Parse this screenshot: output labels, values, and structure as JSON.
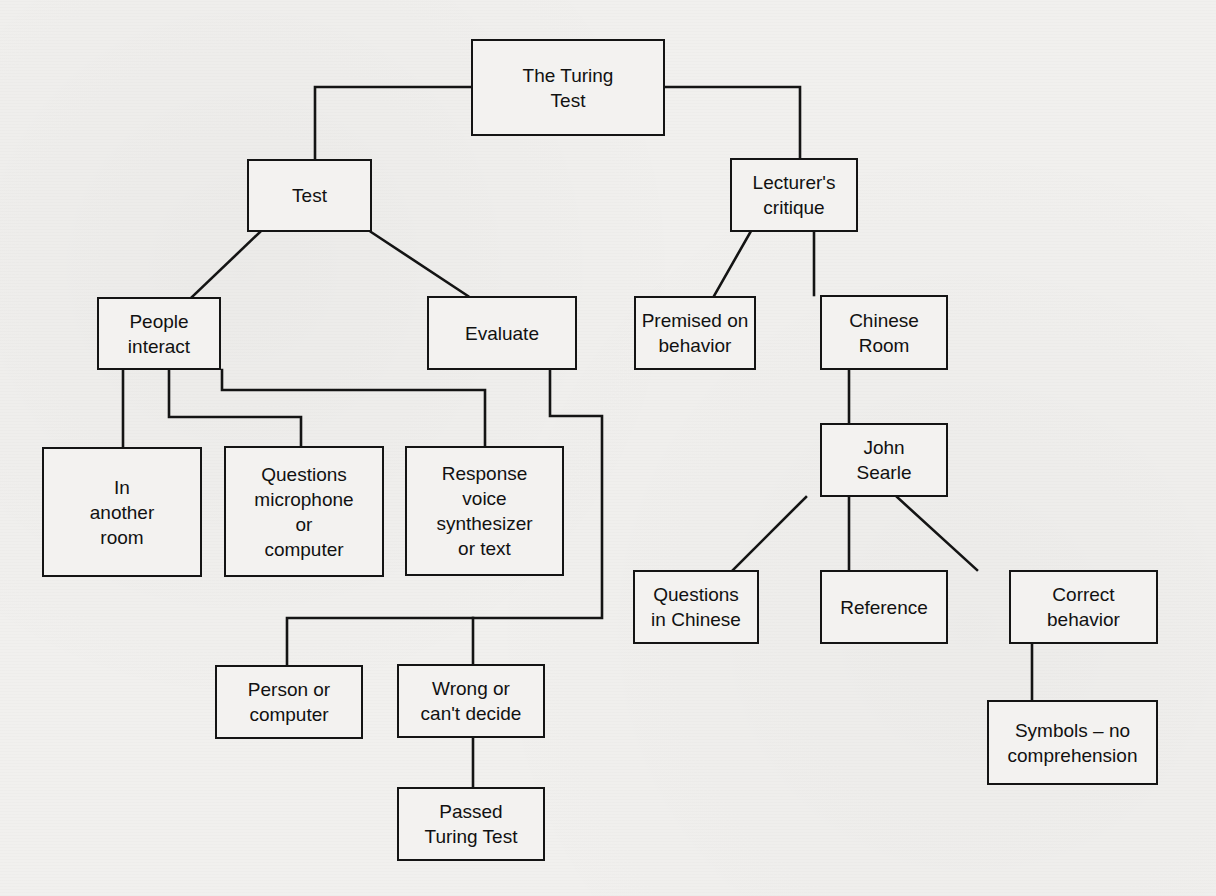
{
  "diagram": {
    "title": "The Turing Test",
    "type": "concept-map",
    "colors": {
      "background": "#f1f0ee",
      "stroke": "#141414",
      "text": "#111111"
    },
    "nodes": {
      "root": {
        "label": "The Turing\nTest"
      },
      "test": {
        "label": "Test"
      },
      "critique": {
        "label": "Lecturer's\ncritique"
      },
      "people_interact": {
        "label": "People\ninteract"
      },
      "evaluate": {
        "label": "Evaluate"
      },
      "premised": {
        "label": "Premised on\nbehavior"
      },
      "chinese_room": {
        "label": "Chinese\nRoom"
      },
      "another_room": {
        "label": "In\nanother\nroom"
      },
      "questions_mic": {
        "label": "Questions\nmicrophone\nor\ncomputer"
      },
      "response": {
        "label": "Response\nvoice\nsynthesizer\nor text"
      },
      "john_searle": {
        "label": "John\nSearle"
      },
      "questions_chinese": {
        "label": "Questions\nin Chinese"
      },
      "reference": {
        "label": "Reference"
      },
      "correct_behavior": {
        "label": "Correct\nbehavior"
      },
      "person_or_computer": {
        "label": "Person or\ncomputer"
      },
      "wrong": {
        "label": "Wrong or\ncan't decide"
      },
      "passed": {
        "label": "Passed\nTuring Test"
      },
      "symbols": {
        "label": "Symbols – no\ncomprehension"
      }
    },
    "edges": [
      [
        "root",
        "test"
      ],
      [
        "root",
        "critique"
      ],
      [
        "test",
        "people_interact"
      ],
      [
        "test",
        "evaluate"
      ],
      [
        "people_interact",
        "another_room"
      ],
      [
        "people_interact",
        "questions_mic"
      ],
      [
        "people_interact",
        "response"
      ],
      [
        "evaluate",
        "person_or_computer"
      ],
      [
        "evaluate",
        "wrong"
      ],
      [
        "wrong",
        "passed"
      ],
      [
        "critique",
        "premised"
      ],
      [
        "critique",
        "chinese_room"
      ],
      [
        "chinese_room",
        "john_searle"
      ],
      [
        "john_searle",
        "questions_chinese"
      ],
      [
        "john_searle",
        "reference"
      ],
      [
        "john_searle",
        "correct_behavior"
      ],
      [
        "correct_behavior",
        "symbols"
      ]
    ]
  }
}
